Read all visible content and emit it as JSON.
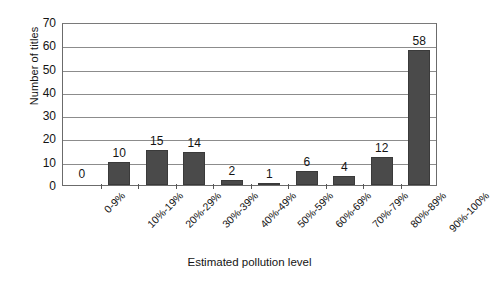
{
  "chart_data": {
    "type": "bar",
    "title": "",
    "xlabel": "Estimated pollution level",
    "ylabel": "Number of titles",
    "categories": [
      "0-9%",
      "10%-19%",
      "20%-29%",
      "30%-39%",
      "40%-49%",
      "50%-59%",
      "60%-69%",
      "70%-79%",
      "80%-89%",
      "90%-100%"
    ],
    "values": [
      0,
      10,
      15,
      14,
      2,
      1,
      6,
      4,
      12,
      58
    ],
    "value_labels": [
      "0",
      "10",
      "15",
      "14",
      "2",
      "1",
      "6",
      "4",
      "12",
      "58"
    ],
    "ylim": [
      0,
      70
    ],
    "ytick_labels": [
      "0",
      "10",
      "20",
      "30",
      "40",
      "50",
      "60",
      "70"
    ],
    "ytick_values": [
      0,
      10,
      20,
      30,
      40,
      50,
      60,
      70
    ],
    "grid": true,
    "legend": "none",
    "bar_color": "#4a4a4a",
    "gridline_color": "#8c8c8c",
    "axis_color": "#6b6b6b",
    "background_color": "#ffffff"
  }
}
